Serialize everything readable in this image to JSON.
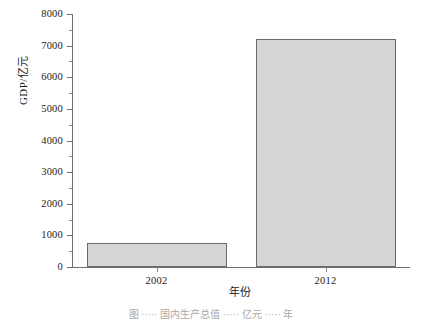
{
  "chart_data": {
    "type": "bar",
    "title": "",
    "xlabel": "年份",
    "ylabel": "GDP/亿元",
    "categories": [
      "2002",
      "2012"
    ],
    "values": [
      750,
      7200
    ],
    "ylim": [
      0,
      8000
    ],
    "yticks": [
      0,
      1000,
      2000,
      3000,
      4000,
      5000,
      6000,
      7000,
      8000
    ],
    "ytick_labels": [
      "0",
      "1000",
      "2000",
      "3000",
      "4000",
      "5000",
      "6000",
      "7000",
      "8000"
    ],
    "yminor_ticks": [
      500,
      1500,
      2500,
      3500,
      4500,
      5500,
      6500,
      7500
    ],
    "grid": false,
    "legend": null,
    "bar_fill_color": "#d5d5d5",
    "bar_edge_color": "#6a6a6a",
    "axis_color": "#6e6e6e",
    "background_color": "#ffffff",
    "spines": [
      "left",
      "bottom"
    ]
  },
  "caption": "图 ····· 国内生产总值 ····· 亿元 ····· 年"
}
